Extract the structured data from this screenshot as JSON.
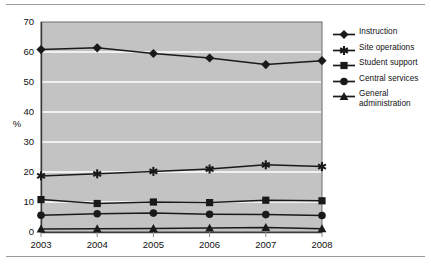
{
  "chart_data": {
    "type": "line",
    "title": "",
    "xlabel": "",
    "ylabel": "%",
    "categories": [
      "2003",
      "2004",
      "2005",
      "2006",
      "2007",
      "2008"
    ],
    "x": [
      2003,
      2004,
      2005,
      2006,
      2007,
      2008
    ],
    "ylim": [
      0,
      70
    ],
    "ytick_step": 10,
    "yticks": [
      "0",
      "10",
      "20",
      "30",
      "40",
      "50",
      "60",
      "70"
    ],
    "grid": "horizontal",
    "legend_position": "right",
    "plot_background": "#c3c3c3",
    "line_color": "#1a1a1a",
    "gridline_color": "#ffffff",
    "series": [
      {
        "name": "Instruction",
        "marker": "diamond",
        "values": [
          60.8,
          61.4,
          59.5,
          58.0,
          55.8,
          57.1
        ]
      },
      {
        "name": "Site operations",
        "marker": "asterisk",
        "values": [
          18.7,
          19.4,
          20.2,
          21.0,
          22.4,
          21.8
        ]
      },
      {
        "name": "Student support",
        "marker": "square",
        "values": [
          10.8,
          9.5,
          10.0,
          9.8,
          10.6,
          10.4
        ]
      },
      {
        "name": "Central services",
        "marker": "circle",
        "values": [
          5.6,
          6.1,
          6.3,
          5.9,
          5.8,
          5.5
        ]
      },
      {
        "name": "General administration",
        "marker": "triangle",
        "values": [
          1.0,
          1.1,
          1.2,
          1.3,
          1.5,
          1.1
        ]
      }
    ]
  },
  "legend": {
    "items": [
      {
        "label": "Instruction",
        "marker": "diamond"
      },
      {
        "label": "Site operations",
        "marker": "asterisk"
      },
      {
        "label": "Student support",
        "marker": "square"
      },
      {
        "label": "Central services",
        "marker": "circle"
      },
      {
        "label": "General administration",
        "marker": "triangle"
      }
    ]
  }
}
